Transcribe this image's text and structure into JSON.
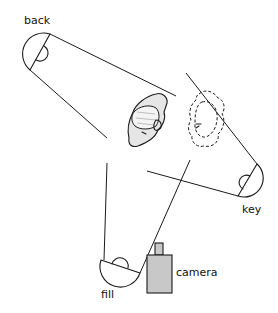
{
  "diagram": {
    "type": "three-point lighting setup",
    "colors": {
      "line": "#1a1a1a",
      "camera_fill": "#c8c8c8",
      "head_fill": "#e6e6e6",
      "background": "#ffffff"
    },
    "lights": [
      {
        "id": "back",
        "label": "back"
      },
      {
        "id": "key",
        "label": "key"
      },
      {
        "id": "fill",
        "label": "fill"
      }
    ],
    "camera": {
      "label": "camera"
    },
    "subject": {
      "solid_head": "subject head (lit)",
      "dashed_head": "subject head (alternate position)"
    }
  }
}
